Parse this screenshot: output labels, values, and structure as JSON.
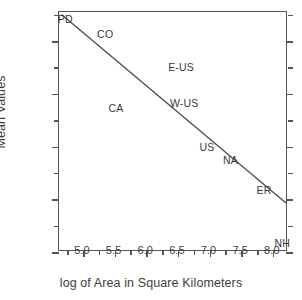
{
  "chart_data": {
    "type": "scatter",
    "title": "",
    "xlabel": "log of Area in Square Kilometers",
    "ylabel": "Mean Values",
    "xlim": [
      4.62,
      8.24
    ],
    "ylim": [
      0.4,
      2.22
    ],
    "grid": false,
    "legend": null,
    "xticks": [
      5.0,
      5.5,
      6.0,
      6.5,
      7.0,
      7.5,
      8.0
    ],
    "xtick_labels": [
      "5.0",
      "5.5",
      "6.0",
      "6.5",
      "7.0",
      "7.5",
      "8.0"
    ],
    "xminor_ticks": [
      4.75,
      5.25,
      5.75,
      6.25,
      6.75,
      7.25,
      7.75
    ],
    "yticks": [
      0.4,
      0.8,
      1.2,
      1.6,
      2.0
    ],
    "ytick_labels": [
      "0.4",
      "0.8",
      "1.2",
      "1.6",
      "2.0"
    ],
    "yminor_ticks": [
      0.6,
      1.0,
      1.4,
      1.8,
      2.2
    ],
    "points": [
      {
        "label": "PD",
        "x": 4.72,
        "y": 2.17
      },
      {
        "label": "CO",
        "x": 5.35,
        "y": 2.05
      },
      {
        "label": "CA",
        "x": 5.52,
        "y": 1.49
      },
      {
        "label": "E-US",
        "x": 6.55,
        "y": 1.8
      },
      {
        "label": "W-US",
        "x": 6.6,
        "y": 1.53
      },
      {
        "label": "US",
        "x": 6.96,
        "y": 1.2
      },
      {
        "label": "NA",
        "x": 7.33,
        "y": 1.1
      },
      {
        "label": "ER",
        "x": 7.86,
        "y": 0.87
      },
      {
        "label": "NH",
        "x": 8.15,
        "y": 0.47
      }
    ],
    "trend_line": {
      "x_start": 4.66,
      "y_start": 2.2,
      "x_end": 8.24,
      "y_end": 0.76,
      "color": "#4a4a4a"
    }
  }
}
